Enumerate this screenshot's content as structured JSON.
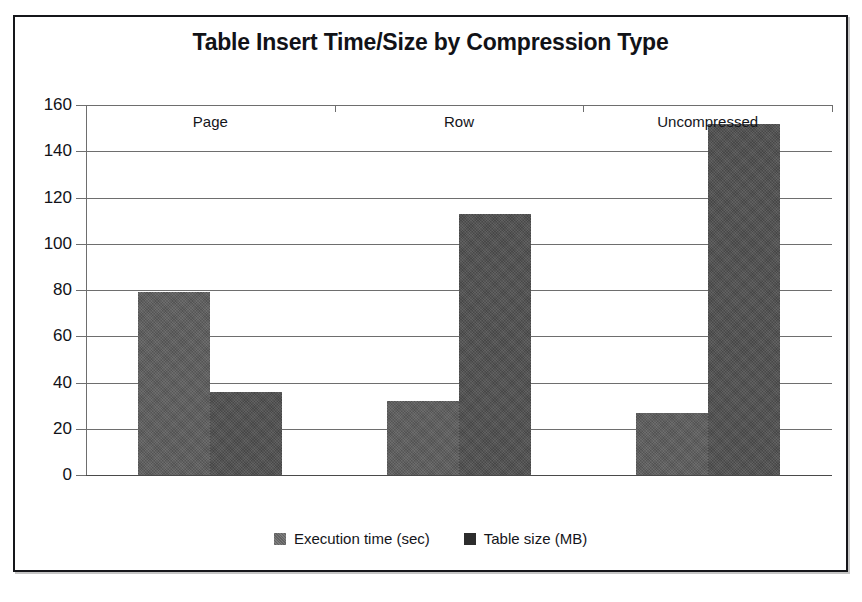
{
  "chart_data": {
    "type": "bar",
    "title": "Table Insert Time/Size by Compression Type",
    "xlabel": "",
    "ylabel": "",
    "categories": [
      "Page",
      "Row",
      "Uncompressed"
    ],
    "series": [
      {
        "name": "Execution time (sec)",
        "values": [
          79,
          32,
          27
        ],
        "color": "#5d5d5d"
      },
      {
        "name": "Table size (MB)",
        "values": [
          36,
          113,
          152
        ],
        "color": "#4f4f4f"
      }
    ],
    "ylim": [
      0,
      160
    ],
    "y_ticks": [
      0,
      20,
      40,
      60,
      80,
      100,
      120,
      140,
      160
    ],
    "y_tick_labels": [
      "0",
      "20",
      "40",
      "60",
      "80",
      "100",
      "120",
      "140",
      "160"
    ],
    "grid": true,
    "legend_position": "bottom"
  },
  "legend": {
    "items": [
      {
        "label": "Execution time (sec)"
      },
      {
        "label": "Table size (MB)"
      }
    ]
  }
}
